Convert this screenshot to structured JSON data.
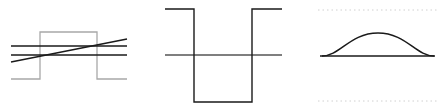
{
  "colors": {
    "background": "#ffffff",
    "ink": "#1a1a1a",
    "gray_pulse": "#a8a8a8",
    "axis_dark": "#555555",
    "dotted": "#d0d0d0"
  },
  "panels": [
    {
      "id": "panel-1",
      "description": "Square pulse (gray) with two horizontal lines and one rising diagonal line",
      "pulse_points": "11,79 40,79 40,32 97,32 97,79 127,79",
      "horizontal_lines": [
        {
          "x1": 11,
          "y1": 46,
          "x2": 127,
          "y2": 46
        },
        {
          "x1": 11,
          "y1": 55,
          "x2": 127,
          "y2": 55
        }
      ],
      "diagonal_line": {
        "x1": 11,
        "y1": 62,
        "x2": 127,
        "y2": 39
      }
    },
    {
      "id": "panel-2",
      "description": "Inverted rectangular pulse (well) crossing a horizontal axis",
      "well_points": "165,9 194,9 194,102 252,102 252,9 282,9",
      "axis_line": {
        "x1": 165,
        "y1": 55,
        "x2": 282,
        "y2": 55
      }
    },
    {
      "id": "panel-3",
      "description": "Gaussian bell curve on a baseline between dotted boundary lines",
      "baseline": {
        "x1": 320,
        "y1": 56,
        "x2": 435,
        "y2": 56
      },
      "curve_path": "M 322 56 C 340 56, 350 33, 378 33 C 406 33, 416 56, 434 56",
      "dotted_top": {
        "x1": 318,
        "y1": 10,
        "x2": 438,
        "y2": 10
      },
      "dotted_bottom": {
        "x1": 318,
        "y1": 101,
        "x2": 438,
        "y2": 101
      }
    }
  ]
}
